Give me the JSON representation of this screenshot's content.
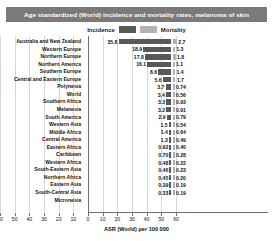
{
  "header": {
    "title": "Age standardized (World) incidence and mortality rates, melanoma of skin"
  },
  "legend": {
    "incidence_label": "Incidence",
    "mortality_label": "Mortality",
    "incidence_color": "#585858",
    "mortality_color": "#b0b0b0",
    "position": "top-center"
  },
  "chart_data": {
    "type": "bar",
    "title": "Age standardized (World) incidence and mortality rates, melanoma of skin",
    "subtype": "butterfly",
    "xlabel": "ASR (World) per 100 000",
    "ylabel": "",
    "grid": true,
    "xlim_left": [
      0,
      60
    ],
    "xlim_right": [
      0,
      60
    ],
    "left_ticks": [
      "60",
      "50",
      "40",
      "30",
      "20",
      "10",
      "0"
    ],
    "right_ticks": [
      "0",
      "10",
      "20",
      "30",
      "40",
      "50",
      "60"
    ],
    "categories": [
      "Australia and New Zealand",
      "Western Europe",
      "Northern  Europe",
      "Northern  America",
      "Southern Europe",
      "Central and Eastern Europe",
      "Polynesia",
      "World",
      "Southern Africa",
      "Melanesia",
      "South America",
      "Western Asia",
      "Middle Africa",
      "Central America",
      "Eastern Africa",
      "Caribbean",
      "Western Africa",
      "South-Eastern Asia",
      "Northern Africa",
      "Eastern Asia",
      "South-Central Asia",
      "Micronesia"
    ],
    "series": [
      {
        "name": "Incidence",
        "side": "left",
        "values": [
          35.8,
          18.9,
          17.8,
          16.1,
          8.6,
          5.6,
          3.7,
          3.4,
          3.3,
          3.2,
          2.9,
          1.5,
          1.4,
          1.3,
          0.92,
          0.7,
          0.48,
          0.46,
          0.45,
          0.39,
          0.33,
          null
        ],
        "labels": [
          "35.8",
          "18.9",
          "17.8",
          "16.1",
          "8.6",
          "5.6",
          "3.7",
          "3.4",
          "3.3",
          "3.2",
          "2.9",
          "1.5",
          "1.4",
          "1.3",
          "0.92",
          "0.70",
          "0.48",
          "0.46",
          "0.45",
          "0.39",
          "0.33",
          ""
        ]
      },
      {
        "name": "Mortality",
        "side": "right",
        "values": [
          2.7,
          1.3,
          1.8,
          1.1,
          1.4,
          1.7,
          0.74,
          0.56,
          0.93,
          0.91,
          0.79,
          0.54,
          0.64,
          0.49,
          0.4,
          0.28,
          0.22,
          0.23,
          0.2,
          0.19,
          0.19,
          null
        ],
        "labels": [
          "2.7",
          "1.3",
          "1.8",
          "1.1",
          "1.4",
          "1.7",
          "0.74",
          "0.56",
          "0.93",
          "0.91",
          "0.79",
          "0.54",
          "0.64",
          "0.49",
          "0.40",
          "0.28",
          "0.22",
          "0.23",
          "0.20",
          "0.19",
          "0.19",
          ""
        ]
      }
    ]
  }
}
